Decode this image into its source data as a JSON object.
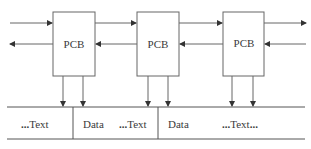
{
  "diagram": {
    "type": "linked-pcb-memory",
    "pcbs": [
      {
        "label": "PCB"
      },
      {
        "label": "PCB"
      },
      {
        "label": "PCB"
      }
    ],
    "memory_segments": [
      {
        "prefix": "...",
        "label": "Text",
        "suffix": ""
      },
      {
        "prefix": "",
        "label": "Data",
        "suffix": ""
      },
      {
        "prefix": "...",
        "label": "Text",
        "suffix": ""
      },
      {
        "prefix": "",
        "label": "Data",
        "suffix": ""
      },
      {
        "prefix": "...",
        "label": "Text",
        "suffix": "..."
      }
    ],
    "colors": {
      "line": "#555555",
      "text": "#3a3a3a",
      "background": "#ffffff"
    }
  }
}
